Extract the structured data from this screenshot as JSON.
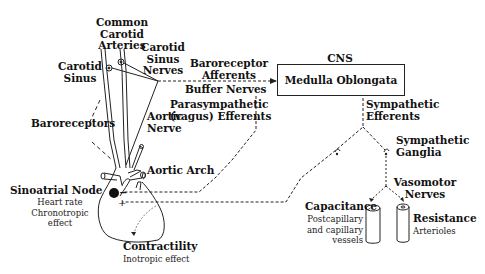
{
  "diagram": {
    "type": "baroreceptor reflex schematic",
    "labels": {
      "common_carotid_arteries": [
        "Common",
        "Carotid",
        "Arteries"
      ],
      "carotid_sinus": [
        "Carotid",
        "Sinus"
      ],
      "carotid_sinus_nerves": [
        "Carotid",
        "Sinus",
        "Nerves"
      ],
      "baroreceptor_afferents": [
        "Baroreceptor",
        "Afferents"
      ],
      "buffer_nerves": "Buffer Nerves",
      "cns": "CNS",
      "medulla_oblongata": "Medulla Oblongata",
      "parasympathetic_efferents": [
        "Parasympathetic",
        "(vagus) Efferents"
      ],
      "sympathetic_efferents": [
        "Sympathetic",
        "Efferents"
      ],
      "baroreceptors": "Baroreceptors",
      "aortic_nerve": [
        "Aortic",
        "Nerve"
      ],
      "sympathetic_ganglia": [
        "Sympathetic",
        "Ganglia"
      ],
      "aortic_arch": "Aortic Arch",
      "sinoatrial_node": "Sinoatrial Node",
      "sinoatrial_sub": [
        "Heart rate",
        "Chronotropic",
        "effect"
      ],
      "vasomotor_nerves": [
        "Vasomotor",
        "Nerves"
      ],
      "capacitance": "Capacitance",
      "capacitance_sub": [
        "Postcapillary",
        "and capillary",
        "vessels"
      ],
      "resistance": "Resistance",
      "resistance_sub": "Arterioles",
      "contractility": "Contractility",
      "contractility_sub": "Inotropic effect",
      "sa_minus": "−",
      "sa_plus": "+"
    },
    "colors": {
      "ink": "#111111",
      "background": "#ffffff"
    }
  }
}
